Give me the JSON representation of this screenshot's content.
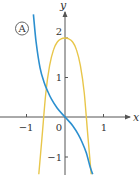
{
  "chart_data": {
    "type": "line",
    "title": "",
    "badge": "A",
    "xlabel": "x",
    "ylabel": "y",
    "xlim": [
      -1.7,
      1.9
    ],
    "ylim": [
      -1.45,
      2.9
    ],
    "x_ticks": [
      -1,
      0,
      1
    ],
    "x_tick_labels": [
      "−1",
      "0",
      "1"
    ],
    "y_ticks": [
      -1,
      1,
      2
    ],
    "y_tick_labels": [
      "−1",
      "1",
      "2"
    ],
    "grid": false,
    "legend": null,
    "colors": {
      "yellow_curve": "#e8c64a",
      "blue_curve": "#2b8fcf",
      "axes": "#555555"
    },
    "series": [
      {
        "name": "yellow-curve",
        "color": "#e8c64a",
        "x": [
          -0.68,
          -0.6,
          -0.5,
          -0.4,
          -0.3,
          -0.2,
          -0.1,
          0,
          0.1,
          0.2,
          0.3,
          0.4,
          0.5,
          0.6,
          0.68
        ],
        "y": [
          -1.45,
          -0.55,
          0.6,
          1.3,
          1.7,
          1.9,
          1.98,
          2.0,
          1.98,
          1.9,
          1.7,
          1.3,
          0.6,
          -0.55,
          -1.45
        ]
      },
      {
        "name": "blue-curve",
        "color": "#2b8fcf",
        "x": [
          -0.82,
          -0.75,
          -0.65,
          -0.55,
          -0.45,
          -0.35,
          -0.2,
          0,
          0.2,
          0.35,
          0.45,
          0.55,
          0.65,
          0.72
        ],
        "y": [
          2.6,
          1.9,
          1.25,
          0.9,
          0.65,
          0.45,
          0.22,
          0,
          -0.22,
          -0.45,
          -0.65,
          -0.9,
          -1.25,
          -1.45
        ]
      }
    ]
  }
}
